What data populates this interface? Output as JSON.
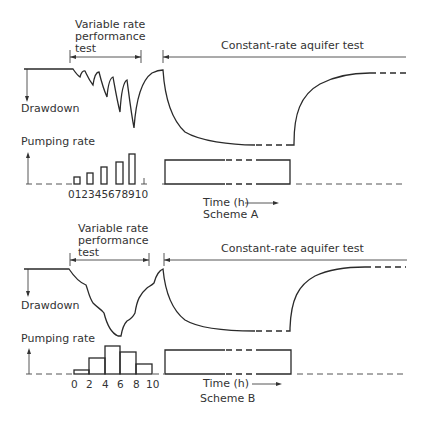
{
  "schemes": [
    {
      "id": "A",
      "caption": "Scheme A",
      "variable_label_lines": [
        "Variable rate",
        "performance",
        "test"
      ],
      "constant_label": "Constant-rate aquifer test",
      "drawdown_label": "Drawdown",
      "pumping_label": "Pumping rate",
      "time_label": "Time (h)",
      "time_ticks": "012345678910",
      "description": "Step-drawdown test with 5 increasing pumping steps, each followed by recovery, then a constant-rate test"
    },
    {
      "id": "B",
      "caption": "Scheme B",
      "variable_label_lines": [
        "Variable rate",
        "performance",
        "test"
      ],
      "constant_label": "Constant-rate aquifer test",
      "drawdown_label": "Drawdown",
      "pumping_label": "Pumping rate",
      "time_label": "Time (h)",
      "time_ticks": [
        "0",
        "2",
        "4",
        "6",
        "8",
        "10"
      ],
      "description": "Variable-rate test with rates increasing then decreasing over 10 h, then a constant-rate test"
    }
  ],
  "colors": {
    "line": "#2a2a2a",
    "text": "#333333",
    "background": "#ffffff"
  }
}
